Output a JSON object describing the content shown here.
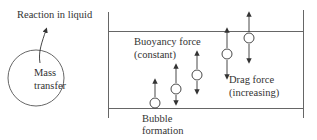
{
  "diagram": {
    "colors": {
      "stroke": "#555555",
      "text": "#333333",
      "background": "#ffffff"
    },
    "left_panel": {
      "reaction_label": "Reaction in liquid",
      "mass_transfer_label_line1": "Mass",
      "mass_transfer_label_line2": "transfer"
    },
    "right_panel": {
      "buoyancy_label_line1": "Buoyancy force",
      "buoyancy_label_line2": "(constant)",
      "drag_label_line1": "Drag force",
      "drag_label_line2": "(increasing)",
      "formation_label_line1": "Bubble",
      "formation_label_line2": "formation"
    },
    "bubbles": [
      {
        "id": 1,
        "cx": 155,
        "cy": 103,
        "up_arrow": true,
        "down_arrow": false
      },
      {
        "id": 2,
        "cx": 176,
        "cy": 89,
        "up_arrow": true,
        "down_arrow": true
      },
      {
        "id": 3,
        "cx": 197,
        "cy": 75,
        "up_arrow": true,
        "down_arrow": true
      },
      {
        "id": 4,
        "cx": 227,
        "cy": 54,
        "up_arrow": true,
        "down_arrow": true
      },
      {
        "id": 5,
        "cx": 249,
        "cy": 38,
        "up_arrow": true,
        "down_arrow": true
      }
    ]
  }
}
